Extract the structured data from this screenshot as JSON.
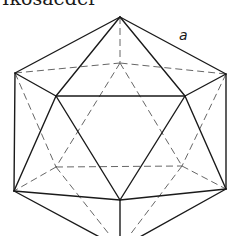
{
  "title": "Ikosaeder",
  "edge_label": "a",
  "colors": {
    "line": "#1a1a1a",
    "hidden_line": "#555555",
    "background": "#ffffff"
  },
  "figure": {
    "type": "icosahedron-wireframe",
    "vertices": {
      "T": [
        120,
        17
      ],
      "UL": [
        15,
        73
      ],
      "UR": [
        226,
        74
      ],
      "FL": [
        56,
        96
      ],
      "FR": [
        185,
        96
      ],
      "BU": [
        120,
        63
      ],
      "LL": [
        14,
        191
      ],
      "LR": [
        226,
        189
      ],
      "FB": [
        120,
        200
      ],
      "BL": [
        56,
        167
      ],
      "BR": [
        182,
        166
      ],
      "B": [
        120,
        248
      ]
    },
    "visible_edges": [
      [
        "T",
        "UL"
      ],
      [
        "T",
        "UR"
      ],
      [
        "T",
        "FL"
      ],
      [
        "T",
        "FR"
      ],
      [
        "UL",
        "FL"
      ],
      [
        "FL",
        "FR"
      ],
      [
        "FR",
        "UR"
      ],
      [
        "UL",
        "LL"
      ],
      [
        "UR",
        "LR"
      ],
      [
        "FL",
        "LL"
      ],
      [
        "FL",
        "FB"
      ],
      [
        "FR",
        "FB"
      ],
      [
        "FR",
        "LR"
      ],
      [
        "LL",
        "FB"
      ],
      [
        "FB",
        "LR"
      ],
      [
        "LL",
        "B"
      ],
      [
        "LR",
        "B"
      ],
      [
        "FB",
        "B"
      ]
    ],
    "hidden_edges": [
      [
        "T",
        "BU"
      ],
      [
        "UL",
        "BU"
      ],
      [
        "UR",
        "BU"
      ],
      [
        "BU",
        "BL"
      ],
      [
        "BU",
        "BR"
      ],
      [
        "UL",
        "BL"
      ],
      [
        "UR",
        "BR"
      ],
      [
        "BL",
        "BR"
      ],
      [
        "BL",
        "LL"
      ],
      [
        "BR",
        "LR"
      ],
      [
        "BL",
        "B"
      ],
      [
        "BR",
        "B"
      ]
    ],
    "label_position": [
      179,
      40
    ]
  }
}
